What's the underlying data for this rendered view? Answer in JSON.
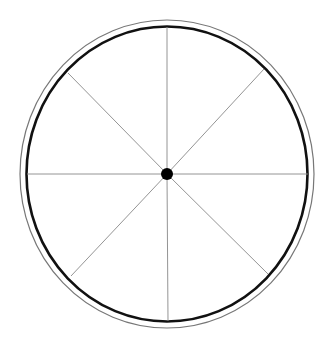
{
  "diagram": {
    "type": "wheel",
    "spoke_count": 8,
    "colors": {
      "background": "#ffffff",
      "rim": "#111111",
      "outer_ring": "#777777",
      "spoke": "#888888",
      "hub": "#000000"
    }
  }
}
